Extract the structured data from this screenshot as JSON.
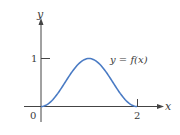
{
  "chart_data": {
    "type": "line",
    "title": "",
    "xlabel": "x",
    "ylabel": "y",
    "curve_label": "y = f(x)",
    "x_ticks": [
      {
        "value": 0,
        "label": "0"
      },
      {
        "value": 2,
        "label": "2"
      }
    ],
    "y_ticks": [
      {
        "value": 1,
        "label": "1"
      }
    ],
    "xlim": [
      0,
      2.5
    ],
    "ylim": [
      0,
      1.6
    ],
    "grid": false,
    "legend": "none",
    "series": [
      {
        "name": "y = f(x)",
        "x": [
          0,
          0.25,
          0.5,
          0.75,
          1,
          1.25,
          1.5,
          1.75,
          2
        ],
        "values": [
          0,
          0.146,
          0.5,
          0.854,
          1,
          0.854,
          0.5,
          0.146,
          0
        ]
      }
    ],
    "colors": {
      "curve": "#4a7bc4",
      "axis": "#444444"
    }
  },
  "labels": {
    "y_axis": "y",
    "x_axis": "x",
    "origin": "0",
    "tick_x2": "2",
    "tick_y1": "1",
    "curve": "y = f(x)"
  }
}
